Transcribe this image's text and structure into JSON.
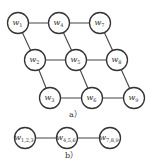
{
  "diagram_a": {
    "caption": "a）",
    "nodes": [
      {
        "id": "w1",
        "base": "w",
        "sub": "1",
        "x": 18,
        "y": 23
      },
      {
        "id": "w4",
        "base": "w",
        "sub": "4",
        "x": 59,
        "y": 23
      },
      {
        "id": "w7",
        "base": "w",
        "sub": "7",
        "x": 100,
        "y": 23
      },
      {
        "id": "w2",
        "base": "w",
        "sub": "2",
        "x": 35,
        "y": 60
      },
      {
        "id": "w5",
        "base": "w",
        "sub": "5",
        "x": 76,
        "y": 60
      },
      {
        "id": "w8",
        "base": "w",
        "sub": "8",
        "x": 117,
        "y": 60
      },
      {
        "id": "w3",
        "base": "w",
        "sub": "3",
        "x": 50,
        "y": 98
      },
      {
        "id": "w6",
        "base": "w",
        "sub": "6",
        "x": 92,
        "y": 98
      },
      {
        "id": "w9",
        "base": "w",
        "sub": "9",
        "x": 134,
        "y": 98
      }
    ],
    "edges": [
      [
        "w1",
        "w4"
      ],
      [
        "w4",
        "w7"
      ],
      [
        "w2",
        "w5"
      ],
      [
        "w5",
        "w8"
      ],
      [
        "w3",
        "w6"
      ],
      [
        "w6",
        "w9"
      ],
      [
        "w1",
        "w2"
      ],
      [
        "w2",
        "w3"
      ],
      [
        "w4",
        "w5"
      ],
      [
        "w5",
        "w6"
      ],
      [
        "w7",
        "w8"
      ],
      [
        "w8",
        "w9"
      ]
    ]
  },
  "diagram_b": {
    "caption": "b）",
    "nodes": [
      {
        "id": "w123",
        "base": "w",
        "sub": "1,2,3",
        "x": 25,
        "y": 138
      },
      {
        "id": "w456",
        "base": "w",
        "sub": "4,5,6",
        "x": 67,
        "y": 138
      },
      {
        "id": "w789",
        "base": "w",
        "sub": "7,8,9",
        "x": 110,
        "y": 138
      }
    ],
    "edges": [
      [
        "w123",
        "w456"
      ],
      [
        "w456",
        "w789"
      ]
    ]
  }
}
